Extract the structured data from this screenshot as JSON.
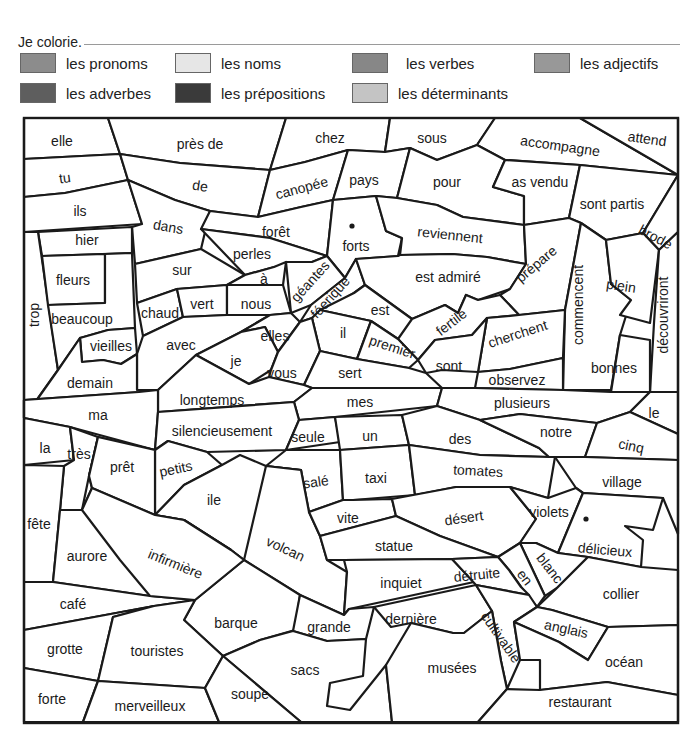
{
  "header": {
    "instruction": "Je colorie."
  },
  "legend": [
    {
      "label": "les pronoms",
      "color": "#8c8c8c",
      "x": 0,
      "y": 0
    },
    {
      "label": "les noms",
      "color": "#e6e6e6",
      "x": 155,
      "y": 0
    },
    {
      "label": "les verbes",
      "color": "#878787",
      "x": 332,
      "y": 0,
      "gap": 18
    },
    {
      "label": "les adjectifs",
      "color": "#989898",
      "x": 514,
      "y": 0
    },
    {
      "label": "les adverbes",
      "color": "#5e5e5e",
      "x": 0,
      "y": 30
    },
    {
      "label": "les prépositions",
      "color": "#3a3a3a",
      "x": 155,
      "y": 30
    },
    {
      "label": "les déterminants",
      "color": "#c4c4c4",
      "x": 332,
      "y": 30
    }
  ],
  "puzzle": {
    "frame": {
      "x": 24,
      "y": 118,
      "w": 654,
      "h": 605
    },
    "cells": [
      {
        "word": "elle",
        "pts": "24,118 108,118 120,154 24,159",
        "tx": 62,
        "ty": 142,
        "r": 0
      },
      {
        "word": "près de",
        "pts": "108,118 286,118 270,170 180,163 120,154",
        "tx": 200,
        "ty": 145,
        "r": 0
      },
      {
        "word": "chez",
        "pts": "286,118 390,118 385,152 348,150 305,162 270,170",
        "tx": 330,
        "ty": 139,
        "r": 0
      },
      {
        "word": "sous",
        "pts": "390,118 495,118 477,145 437,160 410,148 385,152",
        "tx": 432,
        "ty": 139,
        "r": 0
      },
      {
        "word": "accompagne",
        "pts": "495,118 580,118 678,175 580,165 505,160 477,145",
        "tx": 560,
        "ty": 147,
        "r": 8
      },
      {
        "word": "attend",
        "pts": "580,118 678,118 678,175",
        "tx": 647,
        "ty": 140,
        "r": 8
      },
      {
        "word": "tu",
        "pts": "24,159 120,154 128,180 65,193 24,197",
        "tx": 65,
        "ty": 179,
        "r": -8
      },
      {
        "word": "de",
        "pts": "120,154 180,163 270,170 258,217 210,211 175,200 128,180",
        "tx": 200,
        "ty": 187,
        "r": 8
      },
      {
        "word": "canopée",
        "pts": "270,170 305,162 348,150 333,200 301,207 258,217",
        "tx": 302,
        "ty": 189,
        "r": -15
      },
      {
        "word": "pays",
        "pts": "348,150 385,152 410,148 397,198 376,196 333,200",
        "tx": 364,
        "ty": 181,
        "r": 0
      },
      {
        "word": "pour",
        "pts": "410,148 437,160 477,145 505,160 493,187 524,196 524,225 463,217 437,205 397,198",
        "tx": 447,
        "ty": 183,
        "r": 0
      },
      {
        "word": "as vendu",
        "pts": "505,160 580,165 569,218 524,225 524,196 493,187",
        "tx": 540,
        "ty": 183,
        "r": 0
      },
      {
        "word": "ils",
        "pts": "24,197 65,193 128,180 142,224 24,232",
        "tx": 80,
        "ty": 212,
        "r": 0
      },
      {
        "word": "dans",
        "pts": "128,180 175,200 210,211 201,249 135,264 132,227 142,224",
        "tx": 168,
        "ty": 228,
        "r": 10
      },
      {
        "word": "forêt",
        "pts": "210,211 258,217 301,207 333,200 327,256 270,238 201,229",
        "tx": 276,
        "ty": 233,
        "r": 0
      },
      {
        "word": "forts",
        "pts": "333,200 376,196 386,231 402,238 398,256 356,259 345,278 327,256",
        "tx": 356,
        "ty": 247,
        "r": 0
      },
      {
        "word": "reviennent",
        "pts": "376,196 397,198 437,205 463,217 524,225 526,264 487,257 452,254 400,255 402,238 386,231",
        "tx": 450,
        "ty": 236,
        "r": 6
      },
      {
        "word": "sont partis",
        "pts": "569,218 580,165 678,175 643,233 606,240 581,223",
        "tx": 612,
        "ty": 205,
        "r": 0
      },
      {
        "word": "brode",
        "pts": "643,233 678,175 678,232 659,250",
        "tx": 655,
        "ty": 238,
        "r": 28
      },
      {
        "word": "hier",
        "pts": "38,232 132,227 132,253 42,256",
        "tx": 87,
        "ty": 241,
        "r": 0
      },
      {
        "word": "trop",
        "pts": "24,232 38,232 58,370 24,418",
        "tx": 35,
        "ty": 315,
        "r": -90
      },
      {
        "word": "fleurs",
        "pts": "42,256 105,254 105,303 48,305",
        "tx": 73,
        "ty": 281,
        "r": 0
      },
      {
        "word": "beaucoup",
        "pts": "48,305 105,303 105,254 132,253 135,328 108,330 80,338 58,370",
        "tx": 82,
        "ty": 320,
        "r": 0
      },
      {
        "word": "perles",
        "pts": "201,229 270,238 327,256 312,262 274,267 245,275",
        "tx": 252,
        "ty": 255,
        "r": 0
      },
      {
        "word": "sur",
        "pts": "135,264 201,249 245,275 227,285 177,289 137,303",
        "tx": 182,
        "ty": 271,
        "r": 0
      },
      {
        "word": "à",
        "pts": "245,275 274,267 286,262 283,285 227,285",
        "tx": 264,
        "ty": 280,
        "r": 0
      },
      {
        "word": "géantes",
        "pts": "286,262 312,262 327,256 345,278 311,305 291,313",
        "tx": 311,
        "ty": 282,
        "r": -48
      },
      {
        "word": "féerique",
        "pts": "345,278 356,259 365,285 354,293 312,318 300,322 311,305",
        "tx": 331,
        "ty": 298,
        "r": -48
      },
      {
        "word": "est admiré",
        "pts": "356,259 398,256 400,255 452,254 487,257 526,264 510,289 478,300 466,295 458,313 445,305 412,319 365,285",
        "tx": 448,
        "ty": 278,
        "r": 0
      },
      {
        "word": "prépare",
        "pts": "526,264 524,225 569,218 581,223 565,310 519,315 500,295 510,289",
        "tx": 537,
        "ty": 265,
        "r": -40
      },
      {
        "word": "commencent",
        "pts": "581,223 606,240 611,284 631,300 620,335 611,390 563,390 565,310",
        "tx": 579,
        "ty": 305,
        "r": -90
      },
      {
        "word": "plein",
        "pts": "606,240 643,233 659,250 650,323 620,315 631,300 611,284",
        "tx": 621,
        "ty": 287,
        "r": 8
      },
      {
        "word": "découvriront",
        "pts": "659,250 678,232 678,392 650,392 654,323",
        "tx": 664,
        "ty": 315,
        "r": -90
      },
      {
        "word": "chaud",
        "pts": "137,303 177,289 183,317 143,336",
        "tx": 160,
        "ty": 314,
        "r": 0
      },
      {
        "word": "vert",
        "pts": "177,289 227,285 227,315 183,317",
        "tx": 202,
        "ty": 305,
        "r": 0
      },
      {
        "word": "nous",
        "pts": "227,285 283,285 291,313 270,315 227,315",
        "tx": 256,
        "ty": 305,
        "r": 0
      },
      {
        "word": "est",
        "pts": "354,293 365,285 412,319 438,332 398,339 371,321 320,310",
        "tx": 380,
        "ty": 311,
        "r": 0
      },
      {
        "word": "fertile",
        "pts": "398,339 412,319 445,305 458,313 466,295 478,300 500,295 519,315 487,318 472,335 435,340 418,360",
        "tx": 452,
        "ty": 323,
        "r": -38
      },
      {
        "word": "cherchent",
        "pts": "519,315 565,310 563,358 510,369 478,372 487,318",
        "tx": 518,
        "ty": 335,
        "r": -18
      },
      {
        "word": "bonnes",
        "pts": "620,335 650,340 650,392 611,392",
        "tx": 614,
        "ty": 369,
        "r": 0
      },
      {
        "word": "vieilles",
        "pts": "80,338 108,330 135,328 137,354 121,364 103,360 82,362",
        "tx": 111,
        "ty": 347,
        "r": 0
      },
      {
        "word": "avec",
        "pts": "143,336 183,317 227,315 270,315 241,332 196,355 158,390 137,390 137,354",
        "tx": 181,
        "ty": 346,
        "r": 0
      },
      {
        "word": "elles",
        "pts": "270,315 291,313 300,322 278,352 265,327 241,332",
        "tx": 275,
        "ty": 337,
        "r": 0
      },
      {
        "word": "il",
        "pts": "320,310 371,321 357,359 320,351 312,318",
        "tx": 343,
        "ty": 334,
        "r": 0
      },
      {
        "word": "premier",
        "pts": "371,321 398,339 418,360 409,368 357,359",
        "tx": 392,
        "ty": 348,
        "r": 18
      },
      {
        "word": "sont",
        "pts": "418,360 435,340 472,335 487,318 478,372 442,370 426,373",
        "tx": 449,
        "ty": 367,
        "r": 0
      },
      {
        "word": "observez",
        "pts": "478,372 510,369 563,358 563,390 475,388",
        "tx": 517,
        "ty": 381,
        "r": 0
      },
      {
        "word": "je",
        "pts": "196,355 241,332 265,327 278,352 271,370 249,384",
        "tx": 236,
        "ty": 362,
        "r": 0
      },
      {
        "word": "vous",
        "pts": "278,352 300,322 312,318 320,351 304,385 269,377 271,370",
        "tx": 282,
        "ty": 374,
        "r": 0
      },
      {
        "word": "sert",
        "pts": "320,351 357,359 409,368 426,373 442,388 312,388 304,385",
        "tx": 350,
        "ty": 374,
        "r": 0
      },
      {
        "word": "demain",
        "pts": "24,418 58,370 80,338 82,362 103,360 121,364 137,354 137,390 158,390 139,392 24,400",
        "tx": 90,
        "ty": 384,
        "r": 0
      },
      {
        "word": "longtemps",
        "pts": "158,390 196,355 249,384 269,377 304,385 312,388 294,402 158,412",
        "tx": 212,
        "ty": 401,
        "r": 0
      },
      {
        "word": "ma",
        "pts": "24,400 139,392 158,390 158,412 155,450 70,427 24,418",
        "tx": 98,
        "ty": 416,
        "r": 0
      },
      {
        "word": "mes",
        "pts": "312,388 442,388 437,406 335,417 299,420 294,402",
        "tx": 360,
        "ty": 403,
        "r": 0
      },
      {
        "word": "plusieurs",
        "pts": "442,388 475,388 563,390 611,392 650,392 630,412 597,423 520,414 480,420 437,406",
        "tx": 522,
        "ty": 404,
        "r": 0
      },
      {
        "word": "le",
        "pts": "650,392 678,392 678,434 630,412",
        "tx": 654,
        "ty": 414,
        "r": 0
      },
      {
        "word": "silencieusement",
        "pts": "158,412 294,402 299,420 286,450 207,452 168,441 155,450",
        "tx": 222,
        "ty": 432,
        "r": 0
      },
      {
        "word": "seule",
        "pts": "299,420 335,417 340,442 286,450",
        "tx": 308,
        "ty": 438,
        "r": 0
      },
      {
        "word": "un",
        "pts": "335,417 402,415 409,445 340,450",
        "tx": 370,
        "ty": 437,
        "r": 0
      },
      {
        "word": "des",
        "pts": "402,415 437,406 480,420 539,448 549,457 480,455 409,445",
        "tx": 460,
        "ty": 440,
        "r": 0
      },
      {
        "word": "notre",
        "pts": "480,420 520,414 597,423 585,457 549,457 539,448",
        "tx": 556,
        "ty": 433,
        "r": 0
      },
      {
        "word": "cinq",
        "pts": "597,423 630,412 678,434 678,460 585,457",
        "tx": 631,
        "ty": 447,
        "r": 12
      },
      {
        "word": "la",
        "pts": "24,418 70,427 74,460 24,465",
        "tx": 45,
        "ty": 449,
        "r": 0
      },
      {
        "word": "très",
        "pts": "70,427 98,437 89,476 82,510 60,510 64,466 74,460",
        "tx": 79,
        "ty": 455,
        "r": 0
      },
      {
        "word": "prêt",
        "pts": "98,437 155,450 155,515 92,488 89,476",
        "tx": 122,
        "ty": 468,
        "r": 0
      },
      {
        "word": "petits",
        "pts": "155,450 168,441 207,452 222,465 184,485 155,515",
        "tx": 176,
        "ty": 470,
        "r": -12
      },
      {
        "word": "salé",
        "pts": "286,450 340,450 343,500 309,512 301,470 266,466",
        "tx": 316,
        "ty": 483,
        "r": -8
      },
      {
        "word": "taxi",
        "pts": "340,450 409,445 415,495 353,500 343,500",
        "tx": 376,
        "ty": 479,
        "r": 0
      },
      {
        "word": "tomates",
        "pts": "409,445 480,455 549,457 555,457 548,498 510,487 456,487 415,495",
        "tx": 478,
        "ty": 472,
        "r": 3
      },
      {
        "word": "village",
        "pts": "555,457 585,457 678,460 678,534 663,498 583,493 576,488",
        "tx": 622,
        "ty": 483,
        "r": 0
      },
      {
        "word": "fête",
        "pts": "24,465 64,466 60,510 53,582 24,582",
        "tx": 39,
        "ty": 525,
        "r": 0
      },
      {
        "word": "ile",
        "pts": "222,465 240,455 266,466 301,470 244,560 231,550 184,520 155,515 184,485",
        "tx": 214,
        "ty": 501,
        "r": 0
      },
      {
        "word": "volcan",
        "pts": "266,466 301,470 309,512 320,536 327,560 347,572 344,615 300,595 244,560",
        "tx": 285,
        "ty": 550,
        "r": 25
      },
      {
        "word": "vite",
        "pts": "309,512 343,500 353,500 392,499 396,516 320,536",
        "tx": 348,
        "ty": 519,
        "r": 0
      },
      {
        "word": "désert",
        "pts": "392,499 456,487 510,487 536,519 520,543 498,557 440,536 396,516",
        "tx": 464,
        "ty": 519,
        "r": -8
      },
      {
        "word": "violets",
        "pts": "510,487 548,498 576,488 583,493 558,553 536,543 520,543 536,519",
        "tx": 549,
        "ty": 513,
        "r": 0
      },
      {
        "word": "délicieux",
        "pts": "583,493 663,498 653,530 625,526 643,540 641,567 588,557 558,553",
        "tx": 605,
        "ty": 551,
        "r": 5
      },
      {
        "word": "aurore",
        "pts": "53,582 60,510 82,510 92,488 155,515 184,520 231,550 244,560 195,600 150,596",
        "tx": 87,
        "ty": 557,
        "r": 0
      },
      {
        "word": "infirmière",
        "pts": "92,488 89,476 98,437 155,450 155,515",
        "tx": 0,
        "ty": 0,
        "r": 0,
        "hidden": true
      },
      {
        "word": "statue",
        "pts": "320,536 396,516 440,536 498,557 452,559 344,560 327,560",
        "tx": 394,
        "ty": 547,
        "r": 0
      },
      {
        "word": "blanc",
        "pts": "520,543 536,543 558,553 588,557 557,588 545,596",
        "tx": 549,
        "ty": 569,
        "r": 52
      },
      {
        "word": "en",
        "pts": "498,557 520,543 545,596 537,607 521,587 509,570",
        "tx": 524,
        "ty": 578,
        "r": 52
      },
      {
        "word": "café",
        "pts": "24,582 53,582 150,596 195,600 154,606 24,630",
        "tx": 73,
        "ty": 605,
        "r": 0
      },
      {
        "word": "inquiet",
        "pts": "344,560 452,559 474,582 349,609 344,615 347,572",
        "tx": 401,
        "ty": 584,
        "r": 0
      },
      {
        "word": "détruite",
        "pts": "452,559 498,557 509,570 521,587 529,595 476,585",
        "tx": 477,
        "ty": 576,
        "r": -6
      },
      {
        "word": "collier",
        "pts": "557,588 588,557 641,567 678,570 678,625 608,627 552,610 537,607",
        "tx": 621,
        "ty": 595,
        "r": 0
      },
      {
        "word": "barque",
        "pts": "195,600 244,560 300,595 295,630 260,640 223,656 184,620",
        "tx": 236,
        "ty": 624,
        "r": 0
      },
      {
        "word": "grande",
        "pts": "300,595 344,615 349,609 374,607 366,639 327,641 293,631",
        "tx": 329,
        "ty": 628,
        "r": 0
      },
      {
        "word": "dernière",
        "pts": "374,607 476,585 492,611 464,633 453,633 411,623 391,627",
        "tx": 411,
        "ty": 620,
        "r": 0
      },
      {
        "word": "cultivable",
        "pts": "476,585 529,595 537,607 514,622 520,660 507,689 501,661 492,611",
        "tx": 500,
        "ty": 638,
        "r": 55
      },
      {
        "word": "anglais",
        "pts": "537,607 552,610 608,627 588,660 559,642 514,622",
        "tx": 566,
        "ty": 630,
        "r": 12
      },
      {
        "word": "océan",
        "pts": "588,660 608,627 678,625 678,695 607,682 540,690 540,660 520,660 514,622 559,642",
        "tx": 624,
        "ty": 663,
        "r": 0
      },
      {
        "word": "grotte",
        "pts": "24,630 154,606 113,617 98,681 24,668",
        "tx": 65,
        "ty": 650,
        "r": 0
      },
      {
        "word": "touristes",
        "pts": "113,617 154,606 195,600 184,620 223,656 205,688 98,681",
        "tx": 157,
        "ty": 652,
        "r": 0
      },
      {
        "word": "sacs",
        "pts": "223,656 260,640 293,631 327,641 366,639 363,676 330,683 327,706 350,710 386,665 392,722 301,722",
        "tx": 305,
        "ty": 671,
        "r": 0
      },
      {
        "word": "musées",
        "pts": "386,665 411,623 453,633 464,633 492,611 501,661 507,689 478,722 392,722",
        "tx": 452,
        "ty": 669,
        "r": 0
      },
      {
        "word": "restaurant",
        "pts": "507,689 540,690 607,682 678,695 678,722 478,722",
        "tx": 580,
        "ty": 703,
        "r": 0
      },
      {
        "word": "forte",
        "pts": "24,668 98,681 83,722 24,722",
        "tx": 52,
        "ty": 700,
        "r": 0
      },
      {
        "word": "merveilleux",
        "pts": "98,681 205,688 219,722 83,722",
        "tx": 150,
        "ty": 707,
        "r": 0
      },
      {
        "word": "soupe",
        "pts": "205,688 223,656 301,722 219,722",
        "tx": 250,
        "ty": 695,
        "r": 0
      }
    ],
    "extra_words": [
      {
        "word": "infirmière",
        "tx": 175,
        "ty": 565,
        "r": 22
      }
    ],
    "dots": [
      {
        "cx": 352,
        "cy": 226
      },
      {
        "cx": 586,
        "cy": 519
      }
    ]
  }
}
